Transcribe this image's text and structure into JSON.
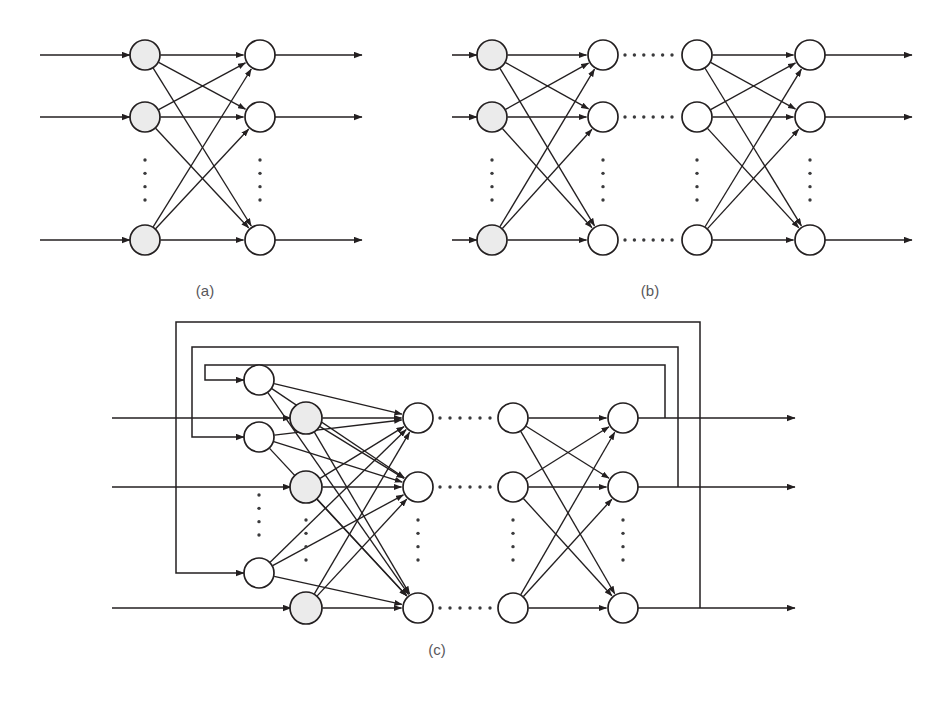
{
  "figure": {
    "background_color": "#ffffff",
    "ink_color": "#231f20",
    "caption_color": "#58585b",
    "shaded_node_color": "#ebebeb",
    "plain_node_color": "#ffffff",
    "width": 946,
    "height": 701
  },
  "panels": [
    {
      "id": "a",
      "caption": "(a)",
      "caption_x": 205,
      "caption_y": 296,
      "kind": "single-hidden-layer feedforward network",
      "layers": [
        {
          "name": "input-layer",
          "x": 145,
          "style": "shaded",
          "radius": 15,
          "rows": [
            55,
            117,
            240
          ]
        },
        {
          "name": "output-layer",
          "x": 260,
          "style": "plain",
          "radius": 15,
          "rows": [
            55,
            117,
            240
          ]
        }
      ],
      "input_arrows": [
        {
          "x1": 40,
          "x2": 130,
          "y": 55
        },
        {
          "x1": 40,
          "x2": 130,
          "y": 117
        },
        {
          "x1": 40,
          "x2": 130,
          "y": 240
        }
      ],
      "output_arrows": [
        {
          "x1": 275,
          "x2": 362,
          "y": 55
        },
        {
          "x1": 275,
          "x2": 362,
          "y": 117
        },
        {
          "x1": 275,
          "x2": 362,
          "y": 240
        }
      ],
      "vertical_ellipses": [
        {
          "x": 145,
          "y1": 160,
          "y2": 200
        },
        {
          "x": 260,
          "y1": 160,
          "y2": 200
        }
      ]
    },
    {
      "id": "b",
      "caption": "(b)",
      "caption_x": 650,
      "caption_y": 296,
      "kind": "deep multi-layer feedforward network",
      "layers": [
        {
          "name": "input-layer",
          "x": 492,
          "style": "shaded",
          "radius": 15,
          "rows": [
            55,
            117,
            240
          ]
        },
        {
          "name": "hidden-layer-1",
          "x": 603,
          "style": "plain",
          "radius": 15,
          "rows": [
            55,
            117,
            240
          ]
        },
        {
          "name": "hidden-layer-n",
          "x": 697,
          "style": "plain",
          "radius": 15,
          "rows": [
            55,
            117,
            240
          ]
        },
        {
          "name": "output-layer",
          "x": 810,
          "style": "plain",
          "radius": 15,
          "rows": [
            55,
            117,
            240
          ]
        }
      ],
      "input_arrows": [
        {
          "x1": 452,
          "x2": 477,
          "y": 55
        },
        {
          "x1": 452,
          "x2": 477,
          "y": 117
        },
        {
          "x1": 452,
          "x2": 477,
          "y": 240
        }
      ],
      "output_arrows": [
        {
          "x1": 825,
          "x2": 912,
          "y": 55
        },
        {
          "x1": 825,
          "x2": 912,
          "y": 117
        },
        {
          "x1": 825,
          "x2": 912,
          "y": 240
        }
      ],
      "horizontal_ellipses": [
        {
          "x1": 625,
          "x2": 672,
          "y": 55
        },
        {
          "x1": 625,
          "x2": 672,
          "y": 117
        },
        {
          "x1": 625,
          "x2": 672,
          "y": 240
        }
      ],
      "vertical_ellipses": [
        {
          "x": 492,
          "y1": 160,
          "y2": 200
        },
        {
          "x": 603,
          "y1": 160,
          "y2": 200
        },
        {
          "x": 697,
          "y1": 160,
          "y2": 200
        },
        {
          "x": 810,
          "y1": 160,
          "y2": 200
        }
      ]
    },
    {
      "id": "c",
      "caption": "(c)",
      "caption_x": 437,
      "caption_y": 655,
      "kind": "recurrent network with output feedback to context units",
      "layers": [
        {
          "name": "context-layer",
          "x": 259,
          "style": "plain",
          "radius": 15,
          "rows": [
            380,
            437,
            573
          ]
        },
        {
          "name": "input-layer",
          "x": 306,
          "style": "shaded",
          "radius": 16,
          "rows": [
            418,
            487,
            608
          ]
        },
        {
          "name": "hidden-layer-1",
          "x": 418,
          "style": "plain",
          "radius": 15,
          "rows": [
            418,
            487,
            608
          ]
        },
        {
          "name": "hidden-layer-n",
          "x": 513,
          "style": "plain",
          "radius": 15,
          "rows": [
            418,
            487,
            608
          ]
        },
        {
          "name": "output-layer",
          "x": 623,
          "style": "plain",
          "radius": 15,
          "rows": [
            418,
            487,
            608
          ]
        }
      ],
      "input_arrows": [
        {
          "x1": 112,
          "x2": 291,
          "y": 418
        },
        {
          "x1": 112,
          "x2": 291,
          "y": 487
        },
        {
          "x1": 112,
          "x2": 291,
          "y": 608
        }
      ],
      "output_arrows": [
        {
          "x1": 638,
          "x2": 795,
          "y": 418
        },
        {
          "x1": 638,
          "x2": 795,
          "y": 487
        },
        {
          "x1": 638,
          "x2": 795,
          "y": 608
        }
      ],
      "horizontal_ellipses": [
        {
          "x1": 440,
          "x2": 490,
          "y": 418
        },
        {
          "x1": 440,
          "x2": 490,
          "y": 487
        },
        {
          "x1": 440,
          "x2": 490,
          "y": 608
        }
      ],
      "vertical_ellipses": [
        {
          "x": 259,
          "y1": 495,
          "y2": 535
        },
        {
          "x": 306,
          "y1": 520,
          "y2": 560
        },
        {
          "x": 418,
          "y1": 520,
          "y2": 560
        },
        {
          "x": 513,
          "y1": 520,
          "y2": 560
        },
        {
          "x": 623,
          "y1": 520,
          "y2": 560
        }
      ],
      "feedback_loops": [
        {
          "name": "feedback-loop-row-1",
          "tap_x": 665,
          "tap_y": 418,
          "top_y": 365,
          "left_x": 205,
          "target_x": 244,
          "target_y": 380
        },
        {
          "name": "feedback-loop-row-2",
          "tap_x": 678,
          "tap_y": 487,
          "top_y": 347,
          "left_x": 192,
          "target_x": 244,
          "target_y": 437
        },
        {
          "name": "feedback-loop-row-3",
          "tap_x": 700,
          "tap_y": 608,
          "top_y": 322,
          "left_x": 176,
          "target_x": 244,
          "target_y": 573
        }
      ]
    }
  ]
}
